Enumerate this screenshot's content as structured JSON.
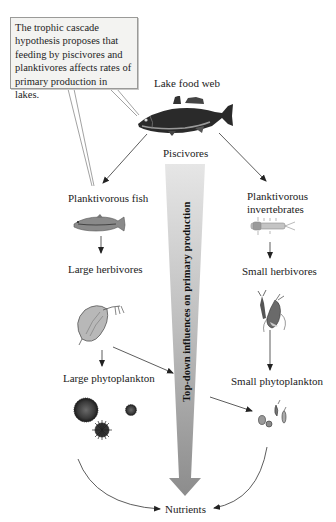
{
  "callout": {
    "lines": [
      "The trophic cascade",
      "hypothesis proposes that",
      "feeding by piscivores and",
      "planktivores affects rates of",
      "primary production in lakes."
    ]
  },
  "diagram": {
    "title": "Lake food web",
    "central_arrow_label": "Top-down influences on primary production",
    "nodes": {
      "piscivores": "Piscivores",
      "planktivorous_fish": "Planktivorous fish",
      "planktivorous_invertebrates_line1": "Planktivorous",
      "planktivorous_invertebrates_line2": "invertebrates",
      "large_herbivores": "Large herbivores",
      "small_herbivores": "Small herbivores",
      "large_phytoplankton": "Large phytoplankton",
      "small_phytoplankton": "Small phytoplankton",
      "nutrients": "Nutrients"
    },
    "icons": {
      "piscivore": "bass-fish-icon",
      "planktivorous_fish": "minnow-fish-icon",
      "planktivorous_invertebrate": "larva-icon",
      "large_herbivore": "daphnia-icon",
      "small_herbivore": "copepod-icon",
      "large_phytoplankton": "colonial-algae-icon",
      "small_phytoplankton": "small-algae-icon"
    },
    "colors": {
      "arrow_gradient_top": "#e4e4e4",
      "arrow_gradient_bottom": "#8e8e8e",
      "callout_bg": "#f3f3f1",
      "callout_border": "#9a9a98",
      "line": "#333333"
    }
  }
}
